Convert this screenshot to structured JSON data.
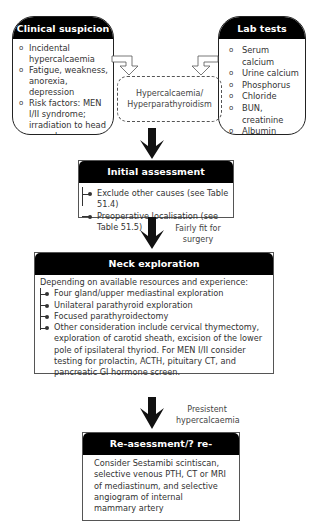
{
  "clinical_suspicion": {
    "title": "Clinical suspicion",
    "items": [
      "Incidental hypercalcaemia",
      "Fatigue, weakness, anorexia, depression",
      "Risk factors: MEN I/II syndrome; irradiation to head or neck"
    ],
    "bullet": "o"
  },
  "lab_tests": {
    "title": "Lab tests",
    "items": [
      "Serum calcium",
      "Urine calcium",
      "Phosphorus",
      "Chloride",
      "BUN, creatinine",
      "Albumin",
      "Intact PTH"
    ],
    "bullet": "o"
  },
  "diagnosis": {
    "line1": "Hypercalcaemia/",
    "line2": "Hyperparathyroidism"
  },
  "initial_assessment": {
    "title": "Initial assessment",
    "items": [
      "Exclude other causes (see Table 51.4)",
      "Preoperative localisation (see Table 51.5)"
    ]
  },
  "arrow_label_1": {
    "line1": "Fairly fit for",
    "line2": "surgery"
  },
  "neck_exploration": {
    "title": "Neck exploration",
    "intro": "Depending on available resources and experience:",
    "items": [
      "Four gland/upper mediastinal exploration",
      "Unilateral parathyroid exploration",
      "Focused parathyroidectomy",
      "Other consideration include cervical thymectomy, exploration of carotid sheath, excision of the lower pole of ipsilateral thyriod. For MEN I/II consider testing for prolactin, ACTH, pituitary CT, and pancreatic GI hormone screen."
    ]
  },
  "arrow_label_2": {
    "line1": "Presistent",
    "line2": "hypercalcaemia"
  },
  "reassessment": {
    "title": "Re-asessment/? re-exploration",
    "body": "Consider Sestamibi scintiscan, selective venous PTH, CT or MRI of mediastinum, and selective angiogram of internal mammary artery"
  }
}
